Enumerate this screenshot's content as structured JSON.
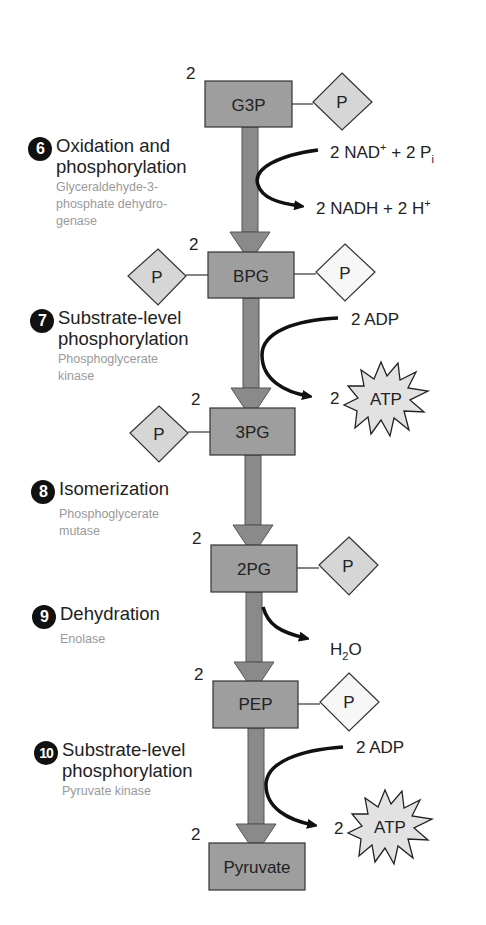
{
  "diagram": {
    "colors": {
      "molecule_box": "#9e9e9e",
      "arrow": "#8a8a8a",
      "phosphate_shaded": "#d6d6d6",
      "phosphate_white": "#f7f7f7",
      "atp_burst": "#e2e2e2",
      "step_number_bg": "#111111",
      "enzyme_text": "#9a9a9a"
    },
    "molecules": [
      {
        "name": "G3P",
        "count": "2"
      },
      {
        "name": "BPG",
        "count": "2"
      },
      {
        "name": "3PG",
        "count": "2"
      },
      {
        "name": "2PG",
        "count": "2"
      },
      {
        "name": "PEP",
        "count": "2"
      },
      {
        "name": "Pyruvate",
        "count": "2"
      }
    ],
    "phosphate_label": "P",
    "steps": [
      {
        "number": "6",
        "title_line1": "Oxidation and",
        "title_line2": "phosphorylation",
        "enzyme_line1": "Glyceraldehyde-3-",
        "enzyme_line2": "phosphate dehydro-",
        "enzyme_line3": "genase"
      },
      {
        "number": "7",
        "title_line1": "Substrate-level",
        "title_line2": "phosphorylation",
        "enzyme_line1": "Phosphoglycerate",
        "enzyme_line2": "kinase"
      },
      {
        "number": "8",
        "title_line1": "Isomerization",
        "enzyme_line1": "Phosphoglycerate",
        "enzyme_line2": "mutase"
      },
      {
        "number": "9",
        "title_line1": "Dehydration",
        "enzyme_line1": "Enolase"
      },
      {
        "number": "10",
        "title_line1": "Substrate-level",
        "title_line2": "phosphorylation",
        "enzyme_line1": "Pyruvate kinase"
      }
    ],
    "side_reactions": {
      "step6_in": {
        "text1": "2 NAD",
        "sup": "+",
        "text2": " + 2 P",
        "sub": "i"
      },
      "step6_out": {
        "text1": "2 NADH + 2 H",
        "sup": "+"
      },
      "step7_in": "2 ADP",
      "step7_out_count": "2",
      "step7_out_label": "ATP",
      "step9_out": {
        "text1": "H",
        "sub": "2",
        "text2": "O"
      },
      "step10_in": "2 ADP",
      "step10_out_count": "2",
      "step10_out_label": "ATP"
    }
  }
}
